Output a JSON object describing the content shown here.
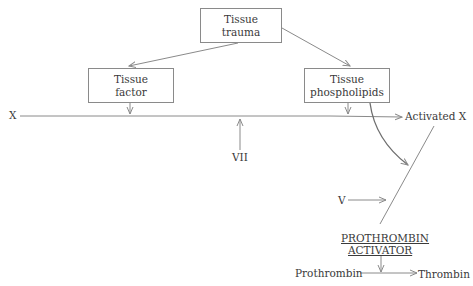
{
  "diagram": {
    "nodes": {
      "tissue_trauma": {
        "line1": "Tissue",
        "line2": "trauma"
      },
      "tissue_factor": {
        "line1": "Tissue",
        "line2": "factor"
      },
      "tissue_phospholipids": {
        "line1": "Tissue",
        "line2": "phospholipids"
      },
      "x": "X",
      "vii": "VII",
      "activated_x": "Activated X",
      "v": "V",
      "prothrombin_activator": {
        "line1": "PROTHROMBIN",
        "line2": "ACTIVATOR"
      },
      "prothrombin": "Prothrombin",
      "thrombin": "Thrombin"
    },
    "edges": [
      {
        "from": "tissue_trauma",
        "to": "tissue_factor"
      },
      {
        "from": "tissue_trauma",
        "to": "tissue_phospholipids"
      },
      {
        "from": "tissue_factor",
        "to": "x_line"
      },
      {
        "from": "tissue_phospholipids",
        "to": "x_line"
      },
      {
        "from": "vii",
        "to": "x_line"
      },
      {
        "from": "x",
        "to": "activated_x"
      },
      {
        "from": "tissue_phospholipids",
        "to": "activated_x_line"
      },
      {
        "from": "v",
        "to": "activated_x_line"
      },
      {
        "from": "activated_x",
        "to": "prothrombin_activator"
      },
      {
        "from": "prothrombin_activator",
        "to": "prothrombin_conversion"
      },
      {
        "from": "prothrombin",
        "to": "thrombin"
      }
    ],
    "colors": {
      "line": "#8a8a8a",
      "text": "#3a3a3a",
      "background": "#ffffff"
    }
  }
}
